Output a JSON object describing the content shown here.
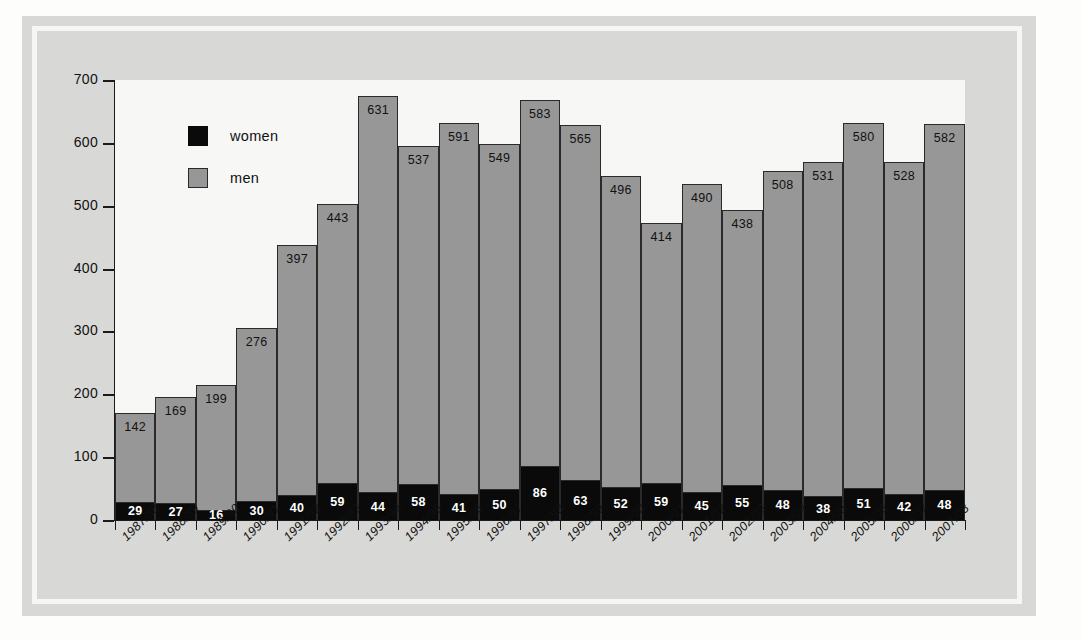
{
  "chart_data": {
    "type": "bar",
    "subtype": "stacked-bar",
    "title": "",
    "xlabel": "",
    "ylabel": "",
    "ylim": [
      0,
      700
    ],
    "yticks": [
      0,
      100,
      200,
      300,
      400,
      500,
      600,
      700
    ],
    "grid": false,
    "legend_position": "upper-left-inside",
    "categories": [
      "1987/88",
      "1988/89",
      "1989/90",
      "1990/91",
      "1991/92",
      "1992/93",
      "1993/94",
      "1994/95",
      "1995/96",
      "1996/97",
      "1997/98",
      "1998/99",
      "1999/00",
      "2000/01",
      "2001/02",
      "2002/03",
      "2003/04",
      "2004/05",
      "2005/06",
      "2006/07",
      "2007/08"
    ],
    "series": [
      {
        "name": "women",
        "color": "#0a0a0a",
        "values": [
          29,
          27,
          16,
          30,
          40,
          59,
          44,
          58,
          41,
          50,
          86,
          63,
          52,
          59,
          45,
          55,
          48,
          38,
          51,
          42,
          48
        ]
      },
      {
        "name": "men",
        "color": "#979797",
        "values": [
          142,
          169,
          199,
          276,
          397,
          443,
          631,
          537,
          591,
          549,
          583,
          565,
          496,
          414,
          490,
          438,
          508,
          531,
          580,
          528,
          582
        ]
      }
    ],
    "totals": [
      171,
      196,
      215,
      306,
      437,
      502,
      675,
      595,
      632,
      599,
      669,
      628,
      548,
      473,
      535,
      493,
      556,
      569,
      631,
      570,
      630
    ]
  },
  "legend": {
    "items": [
      {
        "label": "women",
        "color": "#0a0a0a"
      },
      {
        "label": "men",
        "color": "#979797"
      }
    ]
  },
  "colors": {
    "women": "#0a0a0a",
    "men": "#979797",
    "panel": "#d8d8d6",
    "plot_background": "#f7f7f5",
    "axis": "#1a1a1a"
  }
}
